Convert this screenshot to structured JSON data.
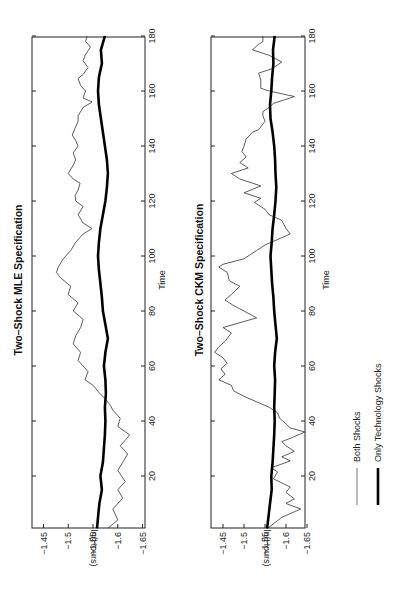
{
  "chart_data": [
    {
      "type": "line",
      "title": "Two–Shock MLE Specification",
      "xlabel": "Time",
      "ylabel": "ln(Hours)",
      "xlim": [
        0,
        180
      ],
      "ylim": [
        -1.65,
        -1.45
      ],
      "xticks": [
        20,
        40,
        60,
        80,
        100,
        120,
        140,
        160,
        180
      ],
      "yticks": [
        -1.45,
        -1.5,
        -1.55,
        -1.6,
        -1.65
      ],
      "ytick_labels": [
        "-1.45",
        "-1.5",
        "-1.55",
        "-1.6",
        "-1.65"
      ],
      "orientation": "rotated 90° counter-clockwise",
      "series": [
        {
          "name": "Both Shocks",
          "style": "thin",
          "x": [
            1,
            4,
            8,
            12,
            15,
            18,
            22,
            25,
            28,
            31,
            33,
            35,
            38,
            41,
            44,
            46,
            48,
            50,
            53,
            55,
            58,
            62,
            65,
            68,
            71,
            74,
            77,
            80,
            83,
            86,
            89,
            92,
            94,
            96,
            99,
            102,
            105,
            108,
            110,
            112,
            115,
            118,
            120,
            122,
            124,
            126.5,
            128,
            130,
            133,
            135,
            137.5,
            140,
            142,
            144,
            147,
            149,
            151,
            154,
            156,
            157.5,
            160,
            162,
            164.5,
            166,
            168.5,
            171,
            173,
            176,
            178,
            180
          ],
          "y": [
            -1.58,
            -1.6,
            -1.59,
            -1.61,
            -1.6,
            -1.615,
            -1.6,
            -1.61,
            -1.62,
            -1.605,
            -1.615,
            -1.624,
            -1.6,
            -1.605,
            -1.59,
            -1.584,
            -1.575,
            -1.564,
            -1.55,
            -1.534,
            -1.54,
            -1.52,
            -1.525,
            -1.51,
            -1.515,
            -1.525,
            -1.53,
            -1.51,
            -1.52,
            -1.5,
            -1.505,
            -1.485,
            -1.476,
            -1.48,
            -1.49,
            -1.505,
            -1.515,
            -1.53,
            -1.548,
            -1.53,
            -1.52,
            -1.53,
            -1.515,
            -1.514,
            -1.52,
            -1.524,
            -1.51,
            -1.5,
            -1.51,
            -1.515,
            -1.51,
            -1.52,
            -1.515,
            -1.508,
            -1.515,
            -1.52,
            -1.52,
            -1.53,
            -1.548,
            -1.53,
            -1.535,
            -1.525,
            -1.52,
            -1.53,
            -1.54,
            -1.53,
            -1.534,
            -1.545,
            -1.535,
            -1.538
          ]
        },
        {
          "name": "Only Technology Shocks",
          "style": "thick",
          "x": [
            1,
            5,
            10,
            15,
            20,
            25,
            30,
            35,
            40,
            45,
            50,
            55,
            60,
            65,
            70,
            75,
            80,
            85,
            90,
            95,
            100,
            105,
            110,
            115,
            120,
            125,
            130,
            135,
            140,
            145,
            150,
            155,
            160,
            165,
            170,
            175,
            180
          ],
          "y": [
            -1.558,
            -1.56,
            -1.563,
            -1.568,
            -1.565,
            -1.57,
            -1.572,
            -1.574,
            -1.575,
            -1.574,
            -1.576,
            -1.575,
            -1.572,
            -1.575,
            -1.58,
            -1.575,
            -1.57,
            -1.568,
            -1.565,
            -1.562,
            -1.56,
            -1.562,
            -1.565,
            -1.57,
            -1.575,
            -1.578,
            -1.58,
            -1.578,
            -1.574,
            -1.57,
            -1.566,
            -1.562,
            -1.56,
            -1.562,
            -1.568,
            -1.566,
            -1.574
          ]
        }
      ]
    },
    {
      "type": "line",
      "title": "Two–Shock CKM Specification",
      "xlabel": "Time",
      "ylabel": "ln(Hours)",
      "xlim": [
        0,
        180
      ],
      "ylim": [
        -1.65,
        -1.45
      ],
      "xticks": [
        20,
        40,
        60,
        80,
        100,
        120,
        140,
        160,
        180
      ],
      "yticks": [
        -1.45,
        -1.5,
        -1.55,
        -1.6,
        -1.65
      ],
      "ytick_labels": [
        "-1.45",
        "-1.5",
        "-1.55",
        "-1.6",
        "-1.65"
      ],
      "orientation": "rotated 90° counter-clockwise",
      "series": [
        {
          "name": "Both Shocks",
          "style": "thin",
          "x": [
            1,
            2,
            5,
            8,
            10,
            11.7,
            14,
            16,
            17.5,
            19,
            21.5,
            23,
            25.5,
            27,
            29,
            31,
            32.5,
            34,
            36,
            37.5,
            39,
            41,
            43,
            45,
            47,
            49,
            51,
            53,
            55,
            57,
            59,
            61,
            63,
            65,
            67,
            69,
            72,
            74,
            77.5,
            80,
            82,
            84,
            86,
            89,
            91,
            94,
            96,
            97,
            99,
            102,
            104,
            106,
            108,
            110,
            113,
            115,
            117,
            119.5,
            121,
            123,
            125.5,
            128,
            130,
            132,
            134,
            136,
            138,
            140,
            142.5,
            145,
            146,
            149,
            151,
            152.5,
            154,
            155.5,
            157,
            158,
            160,
            161,
            164,
            166.5,
            168,
            170.5,
            173,
            175,
            177,
            178,
            180
          ],
          "y": [
            -1.555,
            -1.565,
            -1.59,
            -1.635,
            -1.6,
            -1.62,
            -1.6,
            -1.61,
            -1.59,
            -1.57,
            -1.58,
            -1.565,
            -1.61,
            -1.59,
            -1.62,
            -1.6,
            -1.59,
            -1.615,
            -1.645,
            -1.61,
            -1.6,
            -1.585,
            -1.58,
            -1.56,
            -1.53,
            -1.5,
            -1.475,
            -1.47,
            -1.44,
            -1.455,
            -1.445,
            -1.46,
            -1.45,
            -1.43,
            -1.44,
            -1.455,
            -1.47,
            -1.45,
            -1.53,
            -1.5,
            -1.475,
            -1.455,
            -1.47,
            -1.49,
            -1.465,
            -1.46,
            -1.44,
            -1.45,
            -1.5,
            -1.53,
            -1.55,
            -1.58,
            -1.61,
            -1.6,
            -1.59,
            -1.56,
            -1.55,
            -1.525,
            -1.54,
            -1.5,
            -1.54,
            -1.49,
            -1.47,
            -1.51,
            -1.49,
            -1.505,
            -1.495,
            -1.5,
            -1.505,
            -1.52,
            -1.535,
            -1.55,
            -1.545,
            -1.545,
            -1.56,
            -1.57,
            -1.6,
            -1.62,
            -1.56,
            -1.54,
            -1.54,
            -1.535,
            -1.565,
            -1.59,
            -1.56,
            -1.52,
            -1.535,
            -1.545,
            -1.545
          ]
        },
        {
          "name": "Only Technology Shocks",
          "style": "thick",
          "x": [
            1,
            5,
            10,
            15,
            20,
            25,
            30,
            35,
            40,
            45,
            50,
            55,
            60,
            65,
            70,
            75,
            80,
            85,
            90,
            95,
            100,
            105,
            110,
            115,
            120,
            125,
            130,
            135,
            140,
            145,
            150,
            155,
            160,
            165,
            170,
            175,
            180
          ],
          "y": [
            -1.555,
            -1.558,
            -1.562,
            -1.566,
            -1.565,
            -1.568,
            -1.57,
            -1.572,
            -1.573,
            -1.572,
            -1.573,
            -1.574,
            -1.572,
            -1.574,
            -1.578,
            -1.575,
            -1.572,
            -1.57,
            -1.567,
            -1.565,
            -1.563,
            -1.566,
            -1.568,
            -1.572,
            -1.575,
            -1.577,
            -1.575,
            -1.574,
            -1.572,
            -1.568,
            -1.563,
            -1.562,
            -1.565,
            -1.567,
            -1.57,
            -1.569,
            -1.573
          ]
        }
      ]
    }
  ],
  "legend": {
    "items": [
      {
        "label": "Both Shocks",
        "style": "thin"
      },
      {
        "label": "Only Technology Shocks",
        "style": "thick"
      }
    ]
  }
}
